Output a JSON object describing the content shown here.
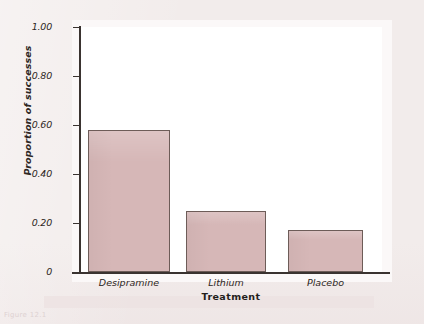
{
  "figure": {
    "background_color": "#f2eceb",
    "panel_color": "#ffffff",
    "axis_color": "#3a3330",
    "bar_fill_color": "#d6b7b7",
    "bar_edge_color": "#6d5c58",
    "caption_fragment": "Figure 12.1"
  },
  "chart_data": {
    "type": "bar",
    "title": "",
    "xlabel": "Treatment",
    "ylabel": "Proportion of successes",
    "categories": [
      "Desipramine",
      "Lithium",
      "Placebo"
    ],
    "values": [
      0.58,
      0.25,
      0.17
    ],
    "series": [
      {
        "name": "Proportion of successes",
        "values": [
          0.58,
          0.25,
          0.17
        ]
      }
    ],
    "ylim": [
      0,
      1.0
    ],
    "ytick_values": [
      0,
      0.2,
      0.4,
      0.6,
      0.8,
      1.0
    ],
    "ytick_labels": [
      "0",
      "0.20",
      "0.40",
      "0.60",
      "0.80",
      "1.00"
    ],
    "grid": false,
    "legend": false,
    "legend_position": "none"
  }
}
